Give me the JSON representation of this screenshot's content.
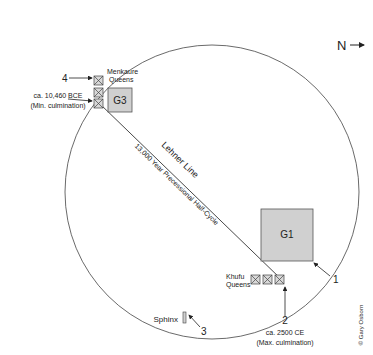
{
  "compass": {
    "label": "N",
    "arrow": "→"
  },
  "pyramids": {
    "g1": {
      "label": "G1",
      "fill": "#d0d0d0"
    },
    "g3": {
      "label": "G3",
      "fill": "#d0d0d0"
    }
  },
  "queens": {
    "menkaure": {
      "line1": "Menkaure",
      "line2": "Queens"
    },
    "khufu": {
      "line1": "Khufu",
      "line2": "Queens"
    }
  },
  "lines": {
    "lehner": "Lehner Line",
    "precession": "13,000 Year Precessional Half-Cycle"
  },
  "markers": {
    "m1": "1",
    "m2": "2",
    "m3": "3",
    "m4": "4"
  },
  "annotations": {
    "min_date": "ca. 10,460 BCE",
    "min_label": "(Min. culmination)",
    "max_date": "ca. 2500 CE",
    "max_label": "(Max. culmination)",
    "sphinx": "Sphinx"
  },
  "credit": "© Gary Osborn"
}
